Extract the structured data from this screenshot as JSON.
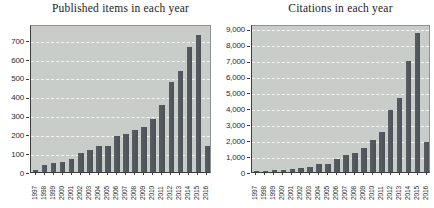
{
  "figure": {
    "background": "#ffffff",
    "plot_background": "#c9cdc9",
    "bar_color": "#575d63",
    "bar_color_dark": "#4c5258",
    "grid_color": "rgba(255,255,255,0.78)",
    "text_color": "#2b2b2b"
  },
  "chart_data": [
    {
      "type": "bar",
      "title": "Published items in each year",
      "categories": [
        "1997",
        "1998",
        "1999",
        "2000",
        "2001",
        "2002",
        "2003",
        "2004",
        "2005",
        "2006",
        "2007",
        "2008",
        "2009",
        "2010",
        "2011",
        "2012",
        "2013",
        "2014",
        "2015",
        "2016"
      ],
      "values": [
        10,
        35,
        48,
        55,
        70,
        100,
        118,
        138,
        138,
        190,
        202,
        224,
        238,
        283,
        357,
        478,
        535,
        663,
        730,
        140
      ],
      "xlabel": "",
      "ylabel": "",
      "ylim": [
        0,
        787
      ],
      "yticks": [
        0,
        100,
        200,
        300,
        400,
        500,
        600,
        700
      ],
      "ytick_labels": [
        "0",
        "100",
        "200",
        "300",
        "400",
        "500",
        "600",
        "700"
      ],
      "grid": true,
      "legend": null
    },
    {
      "type": "bar",
      "title": "Citations in each year",
      "categories": [
        "1997",
        "1998",
        "1999",
        "2000",
        "2001",
        "2002",
        "2003",
        "2004",
        "2005",
        "2006",
        "2007",
        "2008",
        "2009",
        "2010",
        "2011",
        "2012",
        "2013",
        "2014",
        "2015",
        "2016"
      ],
      "values": [
        20,
        55,
        95,
        150,
        200,
        250,
        320,
        505,
        515,
        840,
        1080,
        1170,
        1500,
        2030,
        2520,
        3900,
        4680,
        7000,
        8720,
        1900
      ],
      "xlabel": "",
      "ylabel": "",
      "ylim": [
        0,
        9300
      ],
      "yticks": [
        0,
        1000,
        2000,
        3000,
        4000,
        5000,
        6000,
        7000,
        8000,
        9000
      ],
      "ytick_labels": [
        "0",
        "1,000",
        "2,000",
        "3,000",
        "4,000",
        "5,000",
        "6,000",
        "7,000",
        "8,000",
        "9,000"
      ],
      "grid": true,
      "legend": null
    }
  ]
}
